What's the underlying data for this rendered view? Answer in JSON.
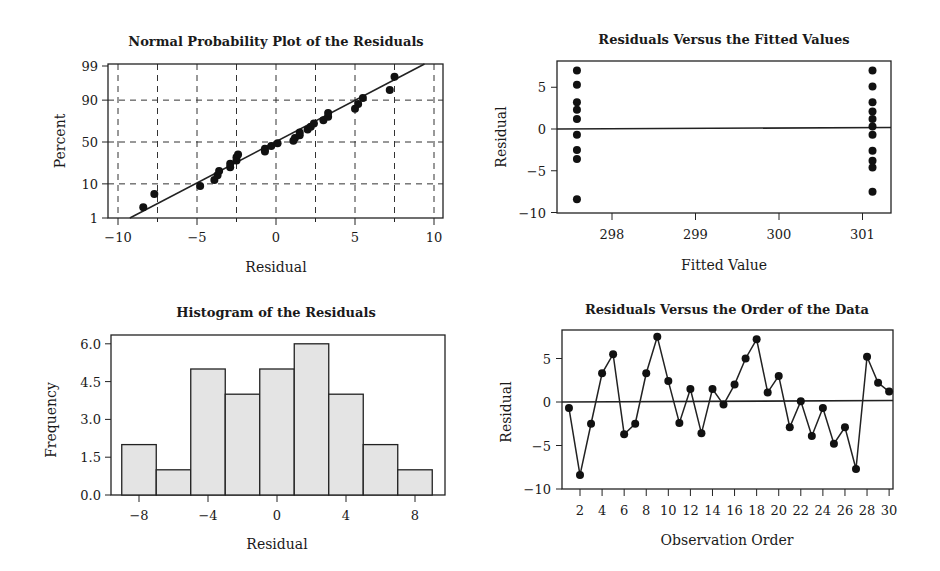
{
  "chart_data": [
    {
      "id": "normal_plot",
      "type": "scatter",
      "title": "Normal Probability Plot of the Residuals",
      "xlabel": "Residual",
      "ylabel": "Percent",
      "xlim": [
        -10,
        10
      ],
      "x_ticks": [
        -10,
        -5,
        0,
        5,
        10
      ],
      "y_ticks": [
        1,
        10,
        50,
        90,
        99
      ],
      "y_scale": "normal-probability",
      "grid": "dashed",
      "fit_line": {
        "mean": 0,
        "sd": 4.0
      },
      "x": [
        -8.4,
        -7.7,
        -4.8,
        -3.9,
        -3.7,
        -3.6,
        -2.9,
        -2.9,
        -2.5,
        -2.5,
        -2.4,
        -0.7,
        -0.7,
        -0.3,
        0.1,
        1.1,
        1.2,
        1.5,
        1.5,
        2.0,
        2.2,
        2.4,
        3.0,
        3.3,
        3.3,
        5.0,
        5.2,
        5.5,
        7.2,
        7.5
      ]
    },
    {
      "id": "fitted_plot",
      "type": "scatter",
      "title": "Residuals Versus the Fitted Values",
      "xlabel": "Fitted Value",
      "ylabel": "Residual",
      "xlim": [
        297.3,
        301.35
      ],
      "ylim": [
        -10,
        8
      ],
      "x_ticks": [
        298,
        299,
        300,
        301
      ],
      "y_ticks": [
        -10,
        -5,
        0,
        5
      ],
      "reference_line": 0,
      "series": [
        {
          "name": "group1",
          "x": 297.58,
          "values": [
            7.0,
            5.3,
            3.2,
            2.3,
            1.2,
            -0.7,
            -2.5,
            -3.6,
            -8.4
          ]
        },
        {
          "name": "group2",
          "x": 301.12,
          "values": [
            7.0,
            5.1,
            3.2,
            2.1,
            1.2,
            0.3,
            -0.7,
            -2.6,
            -3.8,
            -4.6,
            -7.5
          ]
        }
      ]
    },
    {
      "id": "histogram",
      "type": "bar",
      "title": "Histogram of the Residuals",
      "xlabel": "Residual",
      "ylabel": "Frequency",
      "categories": [
        -8,
        -6,
        -4,
        -2,
        0,
        2,
        4,
        6,
        8
      ],
      "values": [
        2,
        1,
        5,
        4,
        5,
        6,
        4,
        2,
        1
      ],
      "bin_width": 2,
      "x_ticks": [
        -8,
        -4,
        0,
        4,
        8
      ],
      "y_ticks": [
        "0.0",
        "1.5",
        "3.0",
        "4.5",
        "6.0"
      ],
      "ylim": [
        0,
        6.3
      ],
      "bar_color": "#e4e4e4"
    },
    {
      "id": "order_plot",
      "type": "line",
      "title": "Residuals Versus the Order of the Data",
      "xlabel": "Observation Order",
      "ylabel": "Residual",
      "x": [
        1,
        2,
        3,
        4,
        5,
        6,
        7,
        8,
        9,
        10,
        11,
        12,
        13,
        14,
        15,
        16,
        17,
        18,
        19,
        20,
        21,
        22,
        23,
        24,
        25,
        26,
        27,
        28,
        29,
        30
      ],
      "values": [
        -0.7,
        -8.4,
        -2.5,
        3.3,
        5.5,
        -3.7,
        -2.5,
        3.3,
        7.5,
        2.4,
        -2.4,
        1.5,
        -3.6,
        1.5,
        -0.3,
        2.0,
        5.0,
        7.2,
        1.1,
        3.0,
        -2.9,
        0.1,
        -3.9,
        -0.7,
        -4.8,
        -2.9,
        -7.7,
        5.2,
        2.2,
        1.2
      ],
      "x_ticks": [
        2,
        4,
        6,
        8,
        10,
        12,
        14,
        16,
        18,
        20,
        22,
        24,
        26,
        28,
        30
      ],
      "y_ticks": [
        -10,
        -5,
        0,
        5
      ],
      "ylim": [
        -10,
        8
      ],
      "reference_line": 0,
      "markers": true
    }
  ]
}
